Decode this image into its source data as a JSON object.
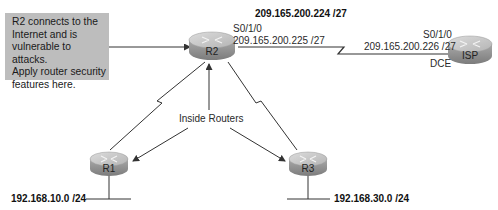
{
  "note": {
    "lines": [
      "R2 connects to the",
      "Internet and is",
      "vulnerable to attacks.",
      "Apply router security",
      "features here."
    ]
  },
  "networks": {
    "wan": "209.165.200.224 /27",
    "r1_lan": "192.168.10.0 /24",
    "r3_lan": "192.168.30.0 /24"
  },
  "r2_interface": {
    "name": "S0/1/0",
    "ip": "209.165.200.225 /27"
  },
  "isp_interface": {
    "name": "S0/1/0",
    "ip": "209.165.200.226 /27",
    "clock": "DCE"
  },
  "inside_label": "Inside Routers",
  "routers": {
    "r1": "R1",
    "r2": "R2",
    "r3": "R3",
    "isp": "ISP"
  },
  "colors": {
    "note_bg": "#bdbdbd",
    "router_top": "#c4c4c4",
    "router_side": "#8e8e8e",
    "line": "#333333"
  }
}
